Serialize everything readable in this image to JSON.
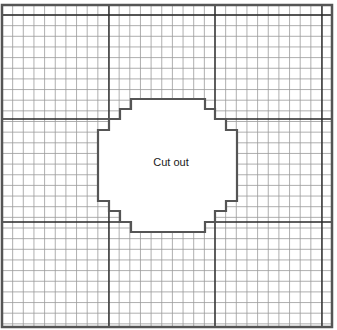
{
  "diagram": {
    "title": "",
    "label": "Cut out",
    "label_center": [
      171,
      162
    ],
    "colors": {
      "background": "#ffffff",
      "minor_grid": "#9a9a9a",
      "major_grid": "#2a2a2a",
      "border": "#555555",
      "cutout_outline": "#555555",
      "cutout_fill": "#ffffff"
    },
    "frame": {
      "x": 2,
      "y": 5,
      "width": 330,
      "height": 322
    },
    "grid": {
      "origin_x": 2,
      "origin_y": 15,
      "cell": 10.65,
      "cols": 31,
      "rows": 30,
      "major_every": 10,
      "major_x": [
        2,
        109,
        215,
        322
      ],
      "major_y": [
        15,
        119,
        222
      ]
    },
    "cutout": {
      "points": [
        [
          131,
          99
        ],
        [
          205,
          99
        ],
        [
          205,
          109
        ],
        [
          215,
          109
        ],
        [
          215,
          119
        ],
        [
          226,
          119
        ],
        [
          226,
          130
        ],
        [
          237,
          130
        ],
        [
          237,
          201
        ],
        [
          226,
          201
        ],
        [
          226,
          211
        ],
        [
          215,
          211
        ],
        [
          215,
          222
        ],
        [
          205,
          222
        ],
        [
          205,
          232
        ],
        [
          131,
          232
        ],
        [
          131,
          222
        ],
        [
          120,
          222
        ],
        [
          120,
          211
        ],
        [
          109,
          211
        ],
        [
          109,
          201
        ],
        [
          98,
          201
        ],
        [
          98,
          130
        ],
        [
          109,
          130
        ],
        [
          109,
          119
        ],
        [
          120,
          119
        ],
        [
          120,
          109
        ],
        [
          131,
          109
        ]
      ]
    }
  }
}
